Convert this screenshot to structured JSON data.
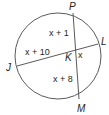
{
  "diagram": {
    "type": "circle-intersecting-chords",
    "points": {
      "P": "P",
      "L": "L",
      "J": "J",
      "M": "M",
      "K": "K"
    },
    "segments": {
      "PK": "x + 1",
      "JK": "x + 10",
      "KL": "x",
      "KM": "x + 8"
    },
    "colors": {
      "stroke": "#5a5a5a",
      "text": "#231f20",
      "background": "#ffffff"
    }
  }
}
